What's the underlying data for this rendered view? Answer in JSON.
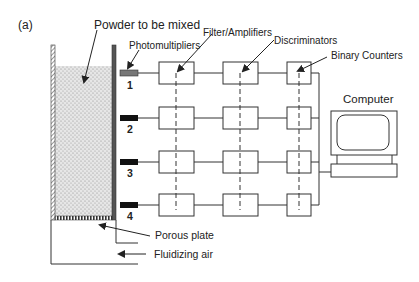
{
  "figure": {
    "panel_label": "(a)",
    "labels": {
      "powder": "Powder to be mixed",
      "photomultipliers": "Photomultipliers",
      "filter_amplifiers": "Filter/Amplifiers",
      "discriminators": "Discriminators",
      "binary_counters": "Binary Counters",
      "computer": "Computer",
      "porous_plate": "Porous plate",
      "fluidizing_air": "Fluidizing air"
    },
    "channels": [
      {
        "number": "1"
      },
      {
        "number": "2"
      },
      {
        "number": "3"
      },
      {
        "number": "4"
      }
    ],
    "colors": {
      "line": "#333333",
      "powder": "#d9d9d9",
      "photomultiplier_1": "#777777",
      "photomultiplier_other": "#111111"
    }
  }
}
